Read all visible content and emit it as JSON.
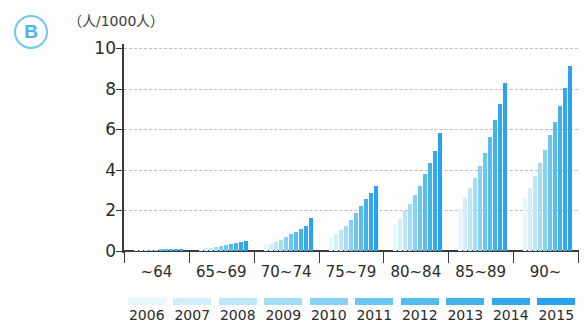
{
  "panel": {
    "badge": "B"
  },
  "axis": {
    "unit_label": "（人/1000人）",
    "y_ticks": [
      "0",
      "2",
      "4",
      "6",
      "8",
      "10"
    ]
  },
  "chart_data": {
    "type": "bar",
    "title": "",
    "subtitle": "",
    "xlabel": "",
    "ylabel": "（人/1000人）",
    "ylim": [
      0,
      10
    ],
    "grid": true,
    "legend_position": "bottom",
    "categories": [
      "~64",
      "65~69",
      "70~74",
      "75~79",
      "80~84",
      "85~89",
      "90~"
    ],
    "series": [
      {
        "name": "2006",
        "color": "#e8f6fd",
        "values": [
          0.03,
          0.1,
          0.28,
          0.7,
          1.35,
          2.1,
          2.6
        ]
      },
      {
        "name": "2007",
        "color": "#d3eefb",
        "values": [
          0.04,
          0.13,
          0.36,
          0.85,
          1.6,
          2.6,
          3.1
        ]
      },
      {
        "name": "2008",
        "color": "#bde6f9",
        "values": [
          0.05,
          0.17,
          0.45,
          1.05,
          1.95,
          3.1,
          3.7
        ]
      },
      {
        "name": "2009",
        "color": "#a3dcf7",
        "values": [
          0.06,
          0.21,
          0.55,
          1.25,
          2.3,
          3.6,
          4.35
        ]
      },
      {
        "name": "2010",
        "color": "#86d1f4",
        "values": [
          0.07,
          0.25,
          0.68,
          1.55,
          2.75,
          4.2,
          5.0
        ]
      },
      {
        "name": "2011",
        "color": "#6bc6f1",
        "values": [
          0.08,
          0.3,
          0.82,
          1.85,
          3.2,
          4.85,
          5.7
        ]
      },
      {
        "name": "2012",
        "color": "#55bcee",
        "values": [
          0.09,
          0.34,
          0.95,
          2.2,
          3.8,
          5.6,
          6.35
        ]
      },
      {
        "name": "2013",
        "color": "#41b2ec",
        "values": [
          0.1,
          0.39,
          1.1,
          2.55,
          4.35,
          6.45,
          7.15
        ]
      },
      {
        "name": "2014",
        "color": "#32a9ea",
        "values": [
          0.11,
          0.44,
          1.25,
          2.85,
          4.95,
          7.25,
          8.05
        ]
      },
      {
        "name": "2015",
        "color": "#29a3ee",
        "values": [
          0.12,
          0.5,
          1.65,
          3.2,
          5.8,
          8.3,
          9.1
        ]
      }
    ]
  }
}
